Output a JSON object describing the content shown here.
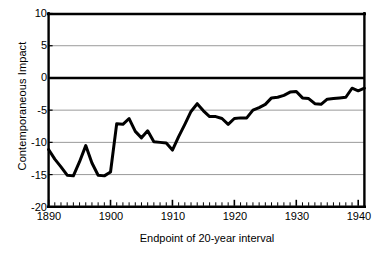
{
  "axes": {
    "ylabel": "Contemporaneous Impact",
    "xlabel": "Endpoint of 20-year interval",
    "yticks": [
      "10",
      "5",
      "0",
      "-5",
      "-10",
      "-15",
      "-20"
    ],
    "xticks": [
      "1890",
      "1900",
      "1910",
      "1920",
      "1930",
      "1940"
    ]
  },
  "chart_data": {
    "type": "line",
    "title": "",
    "subtitle": "",
    "xlabel": "Endpoint of 20-year interval",
    "ylabel": "Contemporaneous Impact",
    "xlim": [
      1890,
      1941
    ],
    "ylim": [
      -20,
      10
    ],
    "ytick_values": [
      10,
      5,
      0,
      -5,
      -10,
      -15,
      -20
    ],
    "xtick_values": [
      1890,
      1900,
      1910,
      1920,
      1930,
      1940
    ],
    "x_minor_tick_step": 1,
    "grid": "horizontal",
    "legend": "none",
    "zero_line": true,
    "line_color": "#000000",
    "line_width_px": 3,
    "series": [
      {
        "name": "Contemporaneous Impact",
        "x": [
          1890,
          1891,
          1892,
          1893,
          1894,
          1895,
          1896,
          1897,
          1898,
          1899,
          1900,
          1901,
          1902,
          1903,
          1904,
          1905,
          1906,
          1907,
          1908,
          1909,
          1910,
          1911,
          1912,
          1913,
          1914,
          1915,
          1916,
          1917,
          1918,
          1919,
          1920,
          1921,
          1922,
          1923,
          1924,
          1925,
          1926,
          1927,
          1928,
          1929,
          1930,
          1931,
          1932,
          1933,
          1934,
          1935,
          1936,
          1937,
          1938,
          1939,
          1940,
          1941
        ],
        "values": [
          -11.1,
          -12.6,
          -13.8,
          -15.1,
          -15.2,
          -13.0,
          -10.5,
          -13.2,
          -15.1,
          -15.2,
          -14.6,
          -7.1,
          -7.2,
          -6.3,
          -8.3,
          -9.3,
          -8.2,
          -9.9,
          -10.0,
          -10.1,
          -11.2,
          -9.1,
          -7.2,
          -5.2,
          -4.0,
          -5.1,
          -6.0,
          -6.0,
          -6.3,
          -7.2,
          -6.3,
          -6.2,
          -6.2,
          -5.0,
          -4.6,
          -4.1,
          -3.1,
          -3.0,
          -2.7,
          -2.2,
          -2.1,
          -3.1,
          -3.2,
          -4.0,
          -4.1,
          -3.3,
          -3.2,
          -3.1,
          -3.0,
          -1.6,
          -2.0,
          -1.6
        ]
      }
    ]
  }
}
